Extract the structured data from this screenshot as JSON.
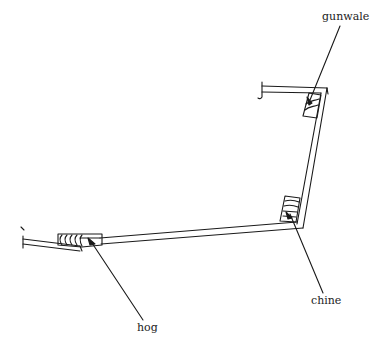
{
  "diagram": {
    "title": "",
    "labels": {
      "gunwale": "gunwale",
      "chine": "chine",
      "hog": "hog"
    },
    "colors": {
      "line": "#1a1a1a",
      "background": "#ffffff"
    }
  }
}
